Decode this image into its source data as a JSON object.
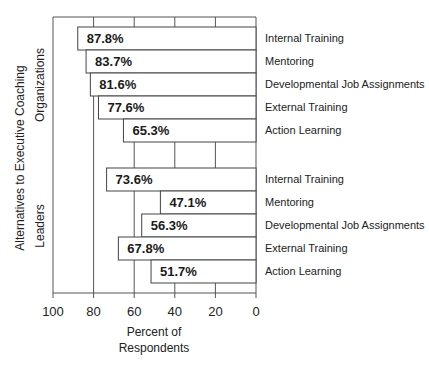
{
  "chart_data": {
    "type": "bar",
    "orientation": "horizontal",
    "direction": "right-to-left",
    "title": "",
    "xlabel": "Percent of Respondents",
    "xlabel_lines": [
      "Percent of",
      "Respondents"
    ],
    "ylabel": "Alternatives to Executive Coaching",
    "xlim": [
      100,
      0
    ],
    "xticks": [
      100,
      80,
      60,
      40,
      20,
      0
    ],
    "grid": true,
    "categories": [
      "Internal Training",
      "Mentoring",
      "Developmental Job Assignments",
      "External Training",
      "Action Learning"
    ],
    "groups": [
      {
        "name": "Organizations",
        "values": [
          87.8,
          83.7,
          81.6,
          77.6,
          65.3
        ],
        "labels": [
          "87.8%",
          "83.7%",
          "81.6%",
          "77.6%",
          "65.3%"
        ]
      },
      {
        "name": "Leaders",
        "values": [
          73.6,
          47.1,
          56.3,
          67.8,
          51.7
        ],
        "labels": [
          "73.6%",
          "47.1%",
          "56.3%",
          "67.8%",
          "51.7%"
        ]
      }
    ]
  },
  "colors": {
    "bar_fill": "#ffffff",
    "bar_stroke": "#444444",
    "grid": "#555555",
    "text": "#222222"
  }
}
